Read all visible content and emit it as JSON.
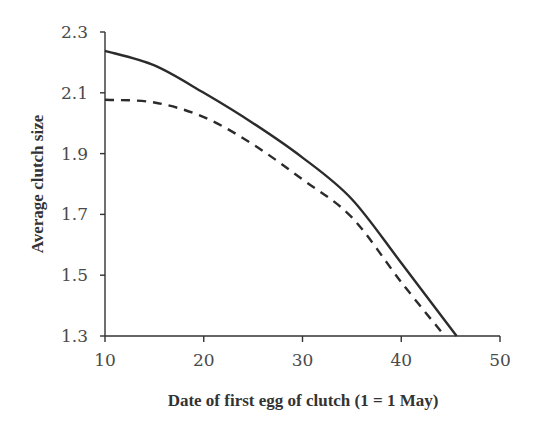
{
  "chart_data": {
    "type": "line",
    "title": "",
    "xlabel": "Date of first egg of clutch (1 = 1 May)",
    "ylabel": "Average clutch size",
    "xlim": [
      10,
      50
    ],
    "ylim": [
      1.3,
      2.3
    ],
    "xticks": [
      10,
      20,
      30,
      40,
      50
    ],
    "xtick_labels": [
      "10",
      "20",
      "30",
      "40",
      "50"
    ],
    "yticks": [
      1.3,
      1.5,
      1.7,
      1.9,
      2.1,
      2.3
    ],
    "ytick_labels": [
      "1.3",
      "1.5",
      "1.7",
      "1.9",
      "2.1",
      "2.3"
    ],
    "grid": false,
    "legend": null,
    "series": [
      {
        "name": "solid",
        "style": "solid",
        "color": "#2b2b2b",
        "x": [
          10,
          15,
          20,
          25,
          30,
          35,
          40,
          45.6
        ],
        "y": [
          2.238,
          2.19,
          2.1,
          2.0,
          1.887,
          1.75,
          1.54,
          1.3
        ]
      },
      {
        "name": "dashed",
        "style": "dashed",
        "color": "#2b2b2b",
        "x": [
          10,
          15,
          20,
          25,
          30,
          35,
          40,
          44.4
        ],
        "y": [
          2.077,
          2.068,
          2.02,
          1.93,
          1.815,
          1.69,
          1.477,
          1.3
        ]
      }
    ]
  }
}
